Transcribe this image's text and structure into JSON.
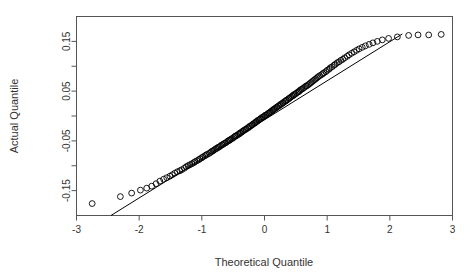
{
  "chart_data": {
    "type": "scatter",
    "title": "",
    "subtitle": "",
    "xlabel": "Theoretical Quantile",
    "ylabel": "Actual Quantile",
    "xlim": [
      -3,
      3
    ],
    "ylim": [
      -0.2,
      0.2
    ],
    "grid": false,
    "legend": null,
    "x_ticks": [
      -3,
      -2,
      -1,
      0,
      1,
      2,
      3
    ],
    "x_tick_labels": [
      "-3",
      "-2",
      "-1",
      "0",
      "1",
      "2",
      "3"
    ],
    "y_ticks": [
      -0.15,
      -0.1,
      -0.05,
      0,
      0.05,
      0.1,
      0.15
    ],
    "y_tick_labels": [
      "-0.15",
      "",
      "-0.05",
      "",
      "0.05",
      "",
      "0.15"
    ],
    "marker": "open-circle",
    "annotations": [],
    "reference_line": {
      "label": "qq-reference-line",
      "x": [
        -2.45,
        2.2
      ],
      "y": [
        -0.2,
        0.165
      ]
    },
    "series": [
      {
        "name": "sample quantiles",
        "x": [
          -2.75,
          -2.3,
          -2.12,
          -1.98,
          -1.88,
          -1.8,
          -1.73,
          -1.67,
          -1.61,
          -1.56,
          -1.51,
          -1.47,
          -1.43,
          -1.39,
          -1.35,
          -1.32,
          -1.28,
          -1.25,
          -1.22,
          -1.19,
          -1.16,
          -1.13,
          -1.11,
          -1.08,
          -1.05,
          -1.03,
          -1.0,
          -0.98,
          -0.95,
          -0.93,
          -0.91,
          -0.88,
          -0.86,
          -0.84,
          -0.82,
          -0.8,
          -0.78,
          -0.76,
          -0.74,
          -0.72,
          -0.7,
          -0.68,
          -0.66,
          -0.64,
          -0.62,
          -0.6,
          -0.58,
          -0.56,
          -0.55,
          -0.53,
          -0.51,
          -0.49,
          -0.47,
          -0.46,
          -0.44,
          -0.42,
          -0.4,
          -0.39,
          -0.37,
          -0.35,
          -0.34,
          -0.32,
          -0.3,
          -0.29,
          -0.27,
          -0.25,
          -0.24,
          -0.22,
          -0.2,
          -0.19,
          -0.17,
          -0.15,
          -0.14,
          -0.12,
          -0.11,
          -0.09,
          -0.07,
          -0.06,
          -0.04,
          -0.02,
          -0.01,
          0.01,
          0.02,
          0.04,
          0.06,
          0.07,
          0.09,
          0.11,
          0.12,
          0.14,
          0.15,
          0.17,
          0.19,
          0.2,
          0.22,
          0.24,
          0.25,
          0.27,
          0.29,
          0.3,
          0.32,
          0.34,
          0.35,
          0.37,
          0.39,
          0.4,
          0.42,
          0.44,
          0.46,
          0.47,
          0.49,
          0.51,
          0.53,
          0.55,
          0.56,
          0.58,
          0.6,
          0.62,
          0.64,
          0.66,
          0.68,
          0.7,
          0.72,
          0.74,
          0.76,
          0.78,
          0.8,
          0.82,
          0.84,
          0.86,
          0.88,
          0.91,
          0.93,
          0.95,
          0.98,
          1.0,
          1.03,
          1.05,
          1.08,
          1.11,
          1.13,
          1.16,
          1.19,
          1.22,
          1.25,
          1.28,
          1.32,
          1.35,
          1.39,
          1.43,
          1.47,
          1.51,
          1.56,
          1.61,
          1.67,
          1.73,
          1.8,
          1.88,
          1.98,
          2.12,
          2.3,
          2.45,
          2.62,
          2.82
        ],
        "y": [
          -0.176,
          -0.162,
          -0.155,
          -0.149,
          -0.145,
          -0.141,
          -0.136,
          -0.131,
          -0.127,
          -0.124,
          -0.121,
          -0.118,
          -0.115,
          -0.112,
          -0.11,
          -0.108,
          -0.105,
          -0.102,
          -0.1,
          -0.098,
          -0.096,
          -0.094,
          -0.092,
          -0.09,
          -0.088,
          -0.086,
          -0.084,
          -0.082,
          -0.08,
          -0.078,
          -0.077,
          -0.075,
          -0.073,
          -0.071,
          -0.07,
          -0.068,
          -0.066,
          -0.065,
          -0.063,
          -0.062,
          -0.06,
          -0.058,
          -0.057,
          -0.055,
          -0.054,
          -0.052,
          -0.05,
          -0.049,
          -0.048,
          -0.046,
          -0.045,
          -0.043,
          -0.041,
          -0.04,
          -0.039,
          -0.037,
          -0.036,
          -0.034,
          -0.033,
          -0.031,
          -0.03,
          -0.028,
          -0.027,
          -0.026,
          -0.024,
          -0.023,
          -0.021,
          -0.02,
          -0.018,
          -0.017,
          -0.015,
          -0.014,
          -0.012,
          -0.011,
          -0.009,
          -0.008,
          -0.006,
          -0.005,
          -0.003,
          -0.002,
          -0.001,
          0.001,
          0.002,
          0.003,
          0.005,
          0.006,
          0.008,
          0.009,
          0.011,
          0.012,
          0.014,
          0.015,
          0.017,
          0.018,
          0.02,
          0.021,
          0.023,
          0.024,
          0.026,
          0.027,
          0.029,
          0.03,
          0.032,
          0.033,
          0.035,
          0.036,
          0.038,
          0.04,
          0.041,
          0.043,
          0.044,
          0.046,
          0.048,
          0.049,
          0.051,
          0.053,
          0.054,
          0.056,
          0.058,
          0.06,
          0.061,
          0.063,
          0.065,
          0.067,
          0.069,
          0.071,
          0.073,
          0.075,
          0.077,
          0.079,
          0.081,
          0.083,
          0.085,
          0.087,
          0.089,
          0.092,
          0.094,
          0.097,
          0.099,
          0.102,
          0.104,
          0.107,
          0.109,
          0.112,
          0.114,
          0.117,
          0.12,
          0.123,
          0.126,
          0.129,
          0.132,
          0.135,
          0.138,
          0.141,
          0.144,
          0.147,
          0.15,
          0.153,
          0.156,
          0.159,
          0.162,
          0.163,
          0.163,
          0.164
        ]
      }
    ]
  }
}
